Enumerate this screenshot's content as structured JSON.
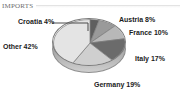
{
  "header": {
    "title": "IMPORTS"
  },
  "chart_data": {
    "type": "pie",
    "title": "IMPORTS",
    "xlabel": "",
    "ylabel": "",
    "legend_position": "none",
    "grid": false,
    "value_suffix": "%",
    "categories": [
      "Croatia",
      "Austria",
      "France",
      "Italy",
      "Germany",
      "Other"
    ],
    "values": [
      4,
      8,
      10,
      17,
      19,
      42
    ],
    "labels": [
      "Croatia 4%",
      "Austria 8%",
      "France 10%",
      "Italy 17%",
      "Germany 19%",
      "Other 42%"
    ],
    "slice_colors": [
      "#5f5f5f",
      "#9a9a9a",
      "#b8b8b8",
      "#6b6b6b",
      "#cfcfcf",
      "#e4e4e4"
    ],
    "slices": [
      {
        "name": "Croatia",
        "value": 4,
        "label": "Croatia 4%",
        "color": "#5f5f5f"
      },
      {
        "name": "Austria",
        "value": 8,
        "label": "Austria 8%",
        "color": "#9a9a9a"
      },
      {
        "name": "France",
        "value": 10,
        "label": "France 10%",
        "color": "#b8b8b8"
      },
      {
        "name": "Italy",
        "value": 17,
        "label": "Italy 17%",
        "color": "#6b6b6b"
      },
      {
        "name": "Germany",
        "value": 19,
        "label": "Germany 19%",
        "color": "#cfcfcf"
      },
      {
        "name": "Other",
        "value": 42,
        "label": "Other 42%",
        "color": "#e4e4e4"
      }
    ]
  },
  "colors": {
    "label_text": "#1b1b1b",
    "header_text": "#6d6d6d",
    "pie_outline": "#7c7c7c",
    "pie_side": "#a8a8a8",
    "background": "#ffffff"
  }
}
